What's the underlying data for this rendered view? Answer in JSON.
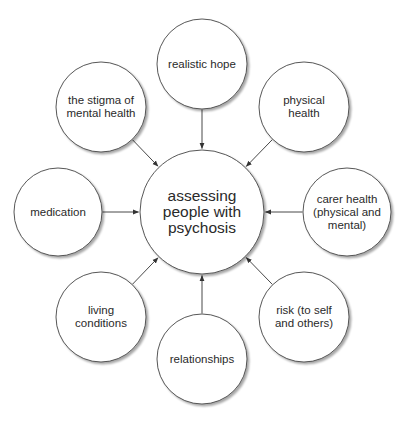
{
  "diagram": {
    "type": "hub-and-spoke",
    "colors": {
      "background": "#ffffff",
      "stroke": "#444444",
      "text": "#2a2a2a",
      "shadow": "#bdbdbd"
    },
    "center": {
      "id": "center",
      "label": "assessing\npeople with\npsychosis",
      "cx": 202,
      "cy": 212,
      "r": 62
    },
    "nodes": [
      {
        "id": "realistic-hope",
        "label": "realistic hope",
        "cx": 202,
        "cy": 64,
        "r": 45
      },
      {
        "id": "physical-health",
        "label": "physical\nhealth",
        "cx": 304,
        "cy": 107,
        "r": 45
      },
      {
        "id": "carer-health",
        "label": "carer health\n(physical and\nmental)",
        "cx": 347,
        "cy": 212,
        "r": 44
      },
      {
        "id": "risk",
        "label": "risk (to self\nand others)",
        "cx": 304,
        "cy": 317,
        "r": 45
      },
      {
        "id": "relationships",
        "label": "relationships",
        "cx": 202,
        "cy": 359,
        "r": 45
      },
      {
        "id": "living-conditions",
        "label": "living\nconditions",
        "cx": 101,
        "cy": 317,
        "r": 45
      },
      {
        "id": "medication",
        "label": "medication",
        "cx": 58,
        "cy": 212,
        "r": 44
      },
      {
        "id": "stigma",
        "label": "the stigma of\nmental health",
        "cx": 101,
        "cy": 107,
        "r": 45
      }
    ],
    "edges": [
      {
        "from": "realistic-hope",
        "to": "center"
      },
      {
        "from": "physical-health",
        "to": "center"
      },
      {
        "from": "carer-health",
        "to": "center"
      },
      {
        "from": "risk",
        "to": "center"
      },
      {
        "from": "relationships",
        "to": "center"
      },
      {
        "from": "living-conditions",
        "to": "center"
      },
      {
        "from": "medication",
        "to": "center"
      },
      {
        "from": "stigma",
        "to": "center"
      }
    ]
  }
}
